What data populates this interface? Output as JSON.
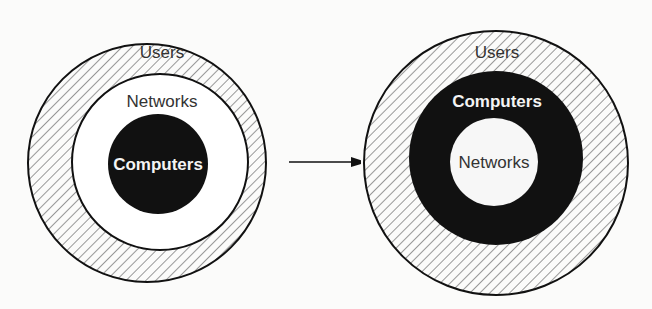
{
  "diagram": {
    "left": {
      "outer_label": "Users",
      "middle_label": "Networks",
      "inner_label": "Computers"
    },
    "right": {
      "outer_label": "Users",
      "middle_label": "Computers",
      "inner_label": "Networks"
    },
    "arrow": "arrow-right"
  },
  "colors": {
    "stroke": "#111111",
    "fill_dark": "#111111",
    "fill_light": "#ffffff",
    "hatch": "#555555"
  }
}
